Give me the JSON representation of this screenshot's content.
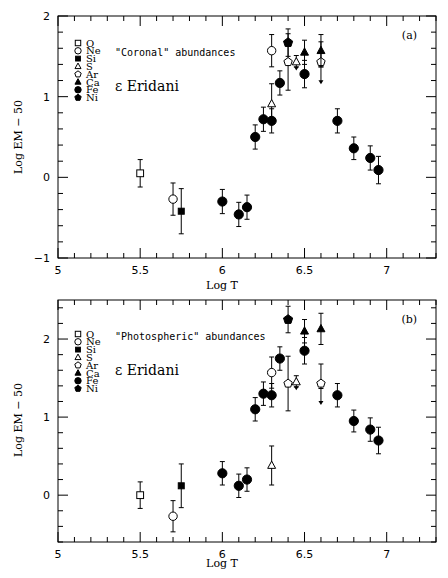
{
  "chart_data": [
    {
      "type": "scatter",
      "panel_label": "(a)",
      "annotation": "\"Coronal\" abundances",
      "star": "ε Eridani",
      "xlabel": "Log T",
      "ylabel": "Log EM − 50",
      "xlim": [
        5,
        7.3
      ],
      "ylim": [
        -1,
        2
      ],
      "xticks": [
        "5",
        "5.5",
        "6",
        "6.5",
        "7"
      ],
      "yticks": [
        "−1",
        "0",
        "1",
        "2"
      ],
      "grid": false,
      "legend_position": "upper left",
      "legend": [
        {
          "label": "O",
          "marker": "open-square"
        },
        {
          "label": "Ne",
          "marker": "open-circle"
        },
        {
          "label": "Si",
          "marker": "filled-square"
        },
        {
          "label": "S",
          "marker": "open-triangle"
        },
        {
          "label": "Ar",
          "marker": "open-pentagon"
        },
        {
          "label": "Ca",
          "marker": "filled-triangle"
        },
        {
          "label": "Fe",
          "marker": "filled-circle"
        },
        {
          "label": "Ni",
          "marker": "filled-pentagon"
        }
      ],
      "series": [
        {
          "name": "O",
          "points": [
            {
              "x": 5.5,
              "y": 0.05,
              "err": 0.17
            }
          ]
        },
        {
          "name": "Ne",
          "points": [
            {
              "x": 5.7,
              "y": -0.27,
              "err": 0.2
            },
            {
              "x": 6.3,
              "y": 1.57,
              "err": 0.2
            }
          ]
        },
        {
          "name": "Si",
          "points": [
            {
              "x": 5.75,
              "y": -0.42,
              "err": 0.28
            }
          ]
        },
        {
          "name": "S",
          "points": [
            {
              "x": 6.3,
              "y": 0.91,
              "err": 0.25
            },
            {
              "x": 6.45,
              "y": 1.43,
              "err": 0.08,
              "upper_limit": true
            }
          ]
        },
        {
          "name": "Ar",
          "points": [
            {
              "x": 6.4,
              "y": 1.43,
              "err": 0.35
            },
            {
              "x": 6.6,
              "y": 1.43,
              "err": 0.25,
              "upper_limit": true
            }
          ]
        },
        {
          "name": "Ca",
          "points": [
            {
              "x": 6.5,
              "y": 1.55,
              "err": 0.15
            },
            {
              "x": 6.6,
              "y": 1.57,
              "err": 0.2
            }
          ]
        },
        {
          "name": "Fe",
          "points": [
            {
              "x": 6.0,
              "y": -0.3,
              "err": 0.15
            },
            {
              "x": 6.1,
              "y": -0.46,
              "err": 0.15
            },
            {
              "x": 6.15,
              "y": -0.37,
              "err": 0.15
            },
            {
              "x": 6.2,
              "y": 0.5,
              "err": 0.15
            },
            {
              "x": 6.25,
              "y": 0.72,
              "err": 0.15
            },
            {
              "x": 6.3,
              "y": 0.7,
              "err": 0.15
            },
            {
              "x": 6.35,
              "y": 1.17,
              "err": 0.15
            },
            {
              "x": 6.5,
              "y": 1.28,
              "err": 0.17
            },
            {
              "x": 6.7,
              "y": 0.7,
              "err": 0.15
            },
            {
              "x": 6.8,
              "y": 0.36,
              "err": 0.14
            },
            {
              "x": 6.9,
              "y": 0.24,
              "err": 0.15
            },
            {
              "x": 6.95,
              "y": 0.09,
              "err": 0.17
            }
          ]
        },
        {
          "name": "Ni",
          "points": [
            {
              "x": 6.4,
              "y": 1.67,
              "err": 0.17
            }
          ]
        }
      ]
    },
    {
      "type": "scatter",
      "panel_label": "(b)",
      "annotation": "\"Photospheric\" abundances",
      "star": "ε Eridani",
      "xlabel": "Log T",
      "ylabel": "Log EM − 50",
      "xlim": [
        5,
        7.3
      ],
      "ylim": [
        -0.6,
        2.5
      ],
      "xticks": [
        "5",
        "5.5",
        "6",
        "6.5",
        "7"
      ],
      "yticks": [
        "0",
        "1",
        "2"
      ],
      "grid": false,
      "legend_position": "upper left",
      "legend": [
        {
          "label": "O",
          "marker": "open-square"
        },
        {
          "label": "Ne",
          "marker": "open-circle"
        },
        {
          "label": "Si",
          "marker": "filled-square"
        },
        {
          "label": "S",
          "marker": "open-triangle"
        },
        {
          "label": "Ar",
          "marker": "open-pentagon"
        },
        {
          "label": "Ca",
          "marker": "filled-triangle"
        },
        {
          "label": "Fe",
          "marker": "filled-circle"
        },
        {
          "label": "Ni",
          "marker": "filled-pentagon"
        }
      ],
      "series": [
        {
          "name": "O",
          "points": [
            {
              "x": 5.5,
              "y": 0.0,
              "err": 0.17
            }
          ]
        },
        {
          "name": "Ne",
          "points": [
            {
              "x": 5.7,
              "y": -0.27,
              "err": 0.2
            },
            {
              "x": 6.3,
              "y": 1.57,
              "err": 0.2
            }
          ]
        },
        {
          "name": "Si",
          "points": [
            {
              "x": 5.75,
              "y": 0.12,
              "err": 0.28
            }
          ]
        },
        {
          "name": "S",
          "points": [
            {
              "x": 6.3,
              "y": 0.38,
              "err": 0.25
            },
            {
              "x": 6.45,
              "y": 1.45,
              "err": 0.08,
              "upper_limit": true
            }
          ]
        },
        {
          "name": "Ar",
          "points": [
            {
              "x": 6.4,
              "y": 1.43,
              "err": 0.35
            },
            {
              "x": 6.6,
              "y": 1.43,
              "err": 0.25,
              "upper_limit": true
            }
          ]
        },
        {
          "name": "Ca",
          "points": [
            {
              "x": 6.5,
              "y": 2.1,
              "err": 0.15
            },
            {
              "x": 6.6,
              "y": 2.13,
              "err": 0.2
            }
          ]
        },
        {
          "name": "Fe",
          "points": [
            {
              "x": 6.0,
              "y": 0.28,
              "err": 0.15
            },
            {
              "x": 6.1,
              "y": 0.12,
              "err": 0.15
            },
            {
              "x": 6.15,
              "y": 0.2,
              "err": 0.15
            },
            {
              "x": 6.2,
              "y": 1.1,
              "err": 0.15
            },
            {
              "x": 6.25,
              "y": 1.3,
              "err": 0.15
            },
            {
              "x": 6.3,
              "y": 1.28,
              "err": 0.15
            },
            {
              "x": 6.35,
              "y": 1.75,
              "err": 0.15
            },
            {
              "x": 6.5,
              "y": 1.85,
              "err": 0.17
            },
            {
              "x": 6.7,
              "y": 1.28,
              "err": 0.15
            },
            {
              "x": 6.8,
              "y": 0.95,
              "err": 0.14
            },
            {
              "x": 6.9,
              "y": 0.84,
              "err": 0.15
            },
            {
              "x": 6.95,
              "y": 0.7,
              "err": 0.17
            }
          ]
        },
        {
          "name": "Ni",
          "points": [
            {
              "x": 6.4,
              "y": 2.25,
              "err": 0.17
            }
          ]
        }
      ]
    }
  ],
  "panels": [
    {
      "label": "(a)",
      "annotation": "\"Coronal\" abundances",
      "star": "ε Eridani",
      "xlabel": "Log T",
      "ylabel": "Log EM − 50"
    },
    {
      "label": "(b)",
      "annotation": "\"Photospheric\" abundances",
      "star": "ε Eridani",
      "xlabel": "Log T",
      "ylabel": "Log EM − 50"
    }
  ]
}
